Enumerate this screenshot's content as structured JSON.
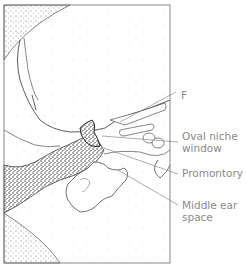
{
  "diagram": {
    "colors": {
      "frame": "#7a7a7a",
      "line": "#333333",
      "label_text": "#8a8a8a",
      "leader_line": "#8a8a8a",
      "stipple_dense": "#222222",
      "stipple_light": "#c8c8c8"
    },
    "labels": [
      {
        "id": "f",
        "text": "F",
        "x": 181,
        "y": 97
      },
      {
        "id": "oval-niche-window",
        "lines": [
          "Oval niche",
          "window"
        ],
        "x": 182,
        "y": 136
      },
      {
        "id": "promontory",
        "text": "Promontory",
        "x": 182,
        "y": 170
      },
      {
        "id": "middle-ear-space",
        "lines": [
          "Middle ear",
          "space"
        ],
        "x": 182,
        "y": 202
      }
    ]
  }
}
